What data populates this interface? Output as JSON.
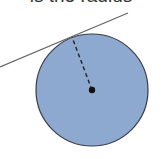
{
  "caption": {
    "text": "is the radius"
  },
  "diagram": {
    "type": "tangent-to-circle",
    "circle": {
      "cx": 92,
      "cy": 90,
      "r": 56,
      "fill": "#8ea9d0",
      "stroke": "#3a3a4a"
    },
    "center_point": {
      "x": 92,
      "y": 90,
      "r": 3.2,
      "color": "#111111"
    },
    "tangent_line": {
      "x1": 0,
      "y1": 67,
      "x2": 128,
      "y2": 13,
      "color": "#666666"
    },
    "radius_line": {
      "x1": 92,
      "y1": 90,
      "x2": 72,
      "y2": 37,
      "style": "dashed",
      "color": "#222222"
    }
  }
}
